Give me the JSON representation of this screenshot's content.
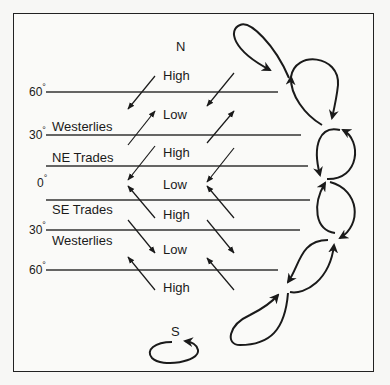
{
  "poles": {
    "north": "N",
    "south": "S"
  },
  "latitudes": [
    {
      "label": "60",
      "symbol": "°",
      "y": 92
    },
    {
      "label": "30",
      "symbol": "°",
      "y": 135
    },
    {
      "label": "0",
      "symbol": "°",
      "y": 183
    },
    {
      "label": "30",
      "symbol": "°",
      "y": 230
    },
    {
      "label": "60",
      "symbol": "°",
      "y": 270
    }
  ],
  "pressure_belts": [
    "High",
    "Low",
    "High",
    "Low",
    "High",
    "Low",
    "High"
  ],
  "wind_belts": [
    "Westerlies",
    "NE Trades",
    "SE Trades",
    "Westerlies"
  ],
  "colors": {
    "ink": "#1a1a1a",
    "background": "#fafaf8"
  }
}
